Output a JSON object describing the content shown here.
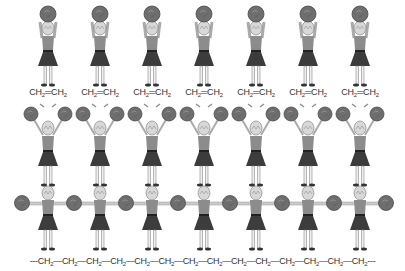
{
  "diagram": {
    "colors": {
      "background": "#ffffff",
      "pompom": "#6e6e6e",
      "pompom_dark": "#4a4a4a",
      "shirt": "#8c8c8c",
      "skirt": "#3c3c3c",
      "hair": "#d8d8d8",
      "text": "#333333"
    },
    "figure_x": [
      48,
      100,
      152,
      204,
      256,
      308,
      360
    ],
    "rows": [
      {
        "name": "monomers",
        "pose": "pompoms-overhead",
        "count": 7,
        "labels": [
          {
            "a": "CH",
            "s1": "2",
            "bond": "═",
            "b": "CH",
            "s2": "2"
          },
          {
            "a": "CH",
            "s1": "2",
            "bond": "═",
            "b": "CH",
            "s2": "2"
          },
          {
            "a": "CH",
            "s1": "2",
            "bond": "═",
            "b": "CH",
            "s2": "2"
          },
          {
            "a": "CH",
            "s1": "2",
            "bond": "═",
            "b": "CH",
            "s2": "2"
          },
          {
            "a": "CH",
            "s1": "2",
            "bond": "═",
            "b": "CH",
            "s2": "2"
          },
          {
            "a": "CH",
            "s1": "2",
            "bond": "═",
            "b": "CH",
            "s2": "2"
          },
          {
            "a": "CH",
            "s1": "2",
            "bond": "═",
            "b": "CH",
            "s2": "2"
          }
        ]
      },
      {
        "name": "activated",
        "pose": "arms-raised-V",
        "count": 7
      },
      {
        "name": "polymer",
        "pose": "arms-outstretched-linked",
        "count": 7,
        "chain": {
          "prefix": "---",
          "unit": "CH",
          "sub": "2",
          "units": 14,
          "bond": "—",
          "suffix": "---"
        }
      }
    ]
  }
}
